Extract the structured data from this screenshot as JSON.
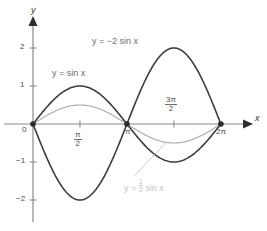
{
  "figure": {
    "kind": "graph-of-sine-transformations",
    "background": "#ffffff"
  },
  "axes": {
    "x_axis_label": "x",
    "y_axis_label": "y",
    "origin_label": "0",
    "y_ticks": [
      {
        "label": "2",
        "value": 2
      },
      {
        "label": "1",
        "value": 1
      },
      {
        "label": "−1",
        "value": -1
      },
      {
        "label": "−2",
        "value": -2
      }
    ],
    "x_ticks": [
      {
        "label": "π/2",
        "numerator": "π",
        "denominator": "2",
        "value": 1.5708,
        "stacked": true,
        "position": "below"
      },
      {
        "label": "π",
        "numerator": "π",
        "denominator": "",
        "value": 3.1416,
        "stacked": false,
        "position": "below"
      },
      {
        "label": "3π/2",
        "numerator": "3π",
        "denominator": "2",
        "value": 4.7124,
        "stacked": true,
        "position": "above"
      },
      {
        "label": "2π",
        "numerator": "2π",
        "denominator": "",
        "value": 6.2832,
        "stacked": false,
        "position": "below"
      }
    ],
    "xlim": [
      -0.25,
      7.15
    ],
    "ylim": [
      -2.55,
      2.75
    ],
    "grid": false,
    "axis_color": "#8a8a8a"
  },
  "curve_labels": {
    "sin": "y = sin x",
    "neg_two_sin": "y = −2 sin x",
    "half_sin_lhs": "y =",
    "half_sin_num": "1",
    "half_sin_den": "2",
    "half_sin_rhs": "sin x"
  },
  "chart_data": {
    "type": "line",
    "title": "",
    "xlabel": "x",
    "ylabel": "y",
    "xlim": [
      0,
      6.2832
    ],
    "ylim": [
      -2,
      2
    ],
    "grid": false,
    "legend": "inline-annotations",
    "x_tick_labels": [
      "0",
      "π/2",
      "π",
      "3π/2",
      "2π"
    ],
    "y_tick_labels": [
      "−2",
      "−1",
      "0",
      "1",
      "2"
    ],
    "series": [
      {
        "name": "y = sin x",
        "expression": "sin(x)",
        "amplitude": 1,
        "color": "#3d3d3d",
        "width": 1.6,
        "key_points": [
          {
            "x": 0,
            "y": 0
          },
          {
            "x": 1.5708,
            "y": 1
          },
          {
            "x": 3.1416,
            "y": 0
          },
          {
            "x": 4.7124,
            "y": -1
          },
          {
            "x": 6.2832,
            "y": 0
          }
        ]
      },
      {
        "name": "y = -2 sin x",
        "expression": "-2*sin(x)",
        "amplitude": 2,
        "color": "#3d3d3d",
        "width": 1.6,
        "key_points": [
          {
            "x": 0,
            "y": 0
          },
          {
            "x": 1.5708,
            "y": -2
          },
          {
            "x": 3.1416,
            "y": 0
          },
          {
            "x": 4.7124,
            "y": 2
          },
          {
            "x": 6.2832,
            "y": 0
          }
        ]
      },
      {
        "name": "y = 1/2 sin x",
        "expression": "0.5*sin(x)",
        "amplitude": 0.5,
        "color": "#a8a8a8",
        "width": 1.1,
        "key_points": [
          {
            "x": 0,
            "y": 0
          },
          {
            "x": 1.5708,
            "y": 0.5
          },
          {
            "x": 3.1416,
            "y": 0
          },
          {
            "x": 4.7124,
            "y": -0.5
          },
          {
            "x": 6.2832,
            "y": 0
          }
        ]
      }
    ],
    "markers": [
      {
        "x": 0,
        "y": 0
      },
      {
        "x": 3.1416,
        "y": 0
      },
      {
        "x": 6.2832,
        "y": 0
      }
    ]
  }
}
